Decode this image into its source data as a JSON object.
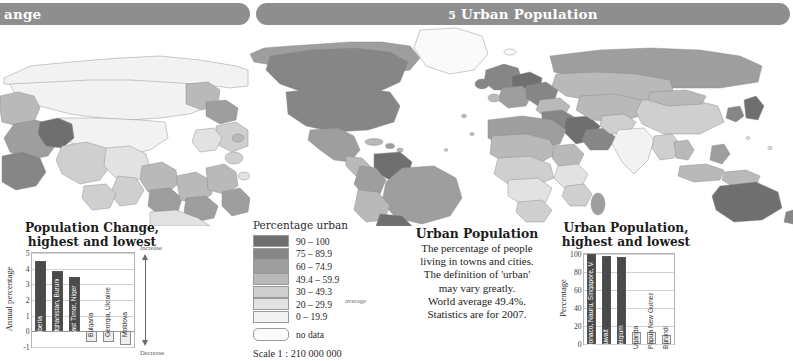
{
  "header": {
    "left_title": "Population Change",
    "left_title_visible": "ange",
    "right_number": "5",
    "right_title": "Urban Population"
  },
  "legend": {
    "title": "Percentage urban",
    "average_note": "average",
    "scale": "Scale 1 : 210 000 000",
    "items": [
      {
        "label": "90 – 100",
        "color": "#6f6f6f"
      },
      {
        "label": "75 – 89.9",
        "color": "#868686"
      },
      {
        "label": "60 – 74.9",
        "color": "#9e9e9e"
      },
      {
        "label": "49.4 – 59.9",
        "color": "#b9b9b9"
      },
      {
        "label": "30 – 49.3",
        "color": "#cfcfcf"
      },
      {
        "label": "20 – 29.9",
        "color": "#e2e2e2"
      },
      {
        "label": "0 – 19.9",
        "color": "#f2f2f2"
      }
    ],
    "no_data_label": "no data",
    "no_data_color": "#fafafa"
  },
  "caption": {
    "title": "Urban Population",
    "lines": [
      "The percentage of people",
      "living in towns and cities.",
      "The definition of 'urban'",
      "may vary greatly.",
      "World average 49.4%.",
      "Statistics are for 2007."
    ]
  },
  "chart_data": [
    {
      "id": "population-change",
      "type": "bar",
      "title": "Population Change,\nhighest and lowest",
      "title_line1": "Population Change,",
      "title_line2": "highest and lowest",
      "ylabel": "Annual percentage",
      "xlabel": "",
      "ylim": [
        -1,
        5
      ],
      "yticks": [
        5,
        4,
        3,
        2,
        1,
        0,
        -1
      ],
      "grid": true,
      "categories": [
        "Liberia",
        "Afghanistan, Burundi",
        "East Timor, Niger",
        "Bulgaria",
        "Georgia, Ukraine",
        "Moldova"
      ],
      "values": [
        4.5,
        3.85,
        3.45,
        -0.7,
        -0.7,
        -0.9
      ],
      "bar_styles": [
        "dark",
        "dark",
        "dark",
        "light",
        "light",
        "light"
      ],
      "annotations": [
        {
          "text": "Increase",
          "position": "top-right"
        },
        {
          "text": "Decrease",
          "position": "bottom-right"
        }
      ]
    },
    {
      "id": "urban-population",
      "type": "bar",
      "title": "Urban Population,\nhighest and lowest",
      "title_line1": "Urban Population,",
      "title_line2": "highest and lowest",
      "ylabel": "Percentage",
      "xlabel": "",
      "ylim": [
        0,
        100
      ],
      "yticks": [
        100,
        80,
        60,
        40,
        20,
        0
      ],
      "grid": true,
      "categories": [
        "Monaco, Nauru, Singapore, Vatican City",
        "Kuwait",
        "Belgium",
        "Uganda",
        "Papua New Guinea",
        "Burundi"
      ],
      "values": [
        100,
        98,
        97,
        13,
        13,
        10
      ],
      "bar_styles": [
        "dark",
        "dark",
        "dark",
        "light",
        "light",
        "light"
      ]
    }
  ]
}
